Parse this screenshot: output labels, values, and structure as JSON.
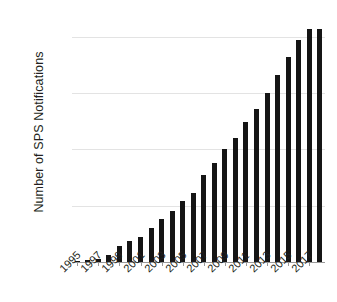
{
  "chart_data": {
    "type": "bar",
    "title": "",
    "xlabel": "",
    "ylabel": "Number of SPS Notifications",
    "categories": [
      "1995",
      "1996",
      "1997",
      "1998",
      "1999",
      "2000",
      "2001",
      "2002",
      "2003",
      "2004",
      "2005",
      "2006",
      "2007",
      "2008",
      "2009",
      "2010",
      "2011",
      "2012",
      "2013",
      "2014",
      "2015",
      "2016",
      "2017",
      "2018"
    ],
    "values": [
      100,
      200,
      300,
      650,
      1400,
      1900,
      2200,
      3050,
      3800,
      4500,
      5400,
      6100,
      7700,
      8800,
      10000,
      11000,
      12400,
      13600,
      15000,
      16600,
      18250,
      19700,
      20700,
      20700
    ],
    "visible_tick_labels": [
      "1995",
      "1997",
      "1999",
      "2001",
      "2003",
      "2005",
      "2007",
      "2009",
      "2011",
      "2013",
      "2015",
      "2017"
    ],
    "ylim": [
      0,
      21500
    ],
    "yticks": [
      0,
      5000,
      10000,
      15000,
      20000
    ],
    "ytick_labels": [
      "0",
      "5000",
      "10000",
      "15000",
      "20000"
    ],
    "grid": true,
    "legend": false,
    "bar_color": "#151515",
    "grid_color": "#e3e3e3",
    "axis_color": "#9a9a9a",
    "series": [
      {
        "name": "SPS Notifications",
        "values": [
          100,
          200,
          300,
          650,
          1400,
          1900,
          2200,
          3050,
          3800,
          4500,
          5400,
          6100,
          7700,
          8800,
          10000,
          11000,
          12400,
          13600,
          15000,
          16600,
          18250,
          19700,
          20700,
          20700
        ]
      }
    ]
  }
}
